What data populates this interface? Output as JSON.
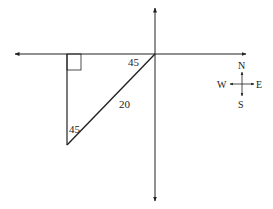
{
  "diagram": {
    "angle_top": "45",
    "angle_bottom": "45",
    "hypotenuse_length": "20",
    "compass": {
      "north": "N",
      "south": "S",
      "east": "E",
      "west": "W"
    }
  }
}
